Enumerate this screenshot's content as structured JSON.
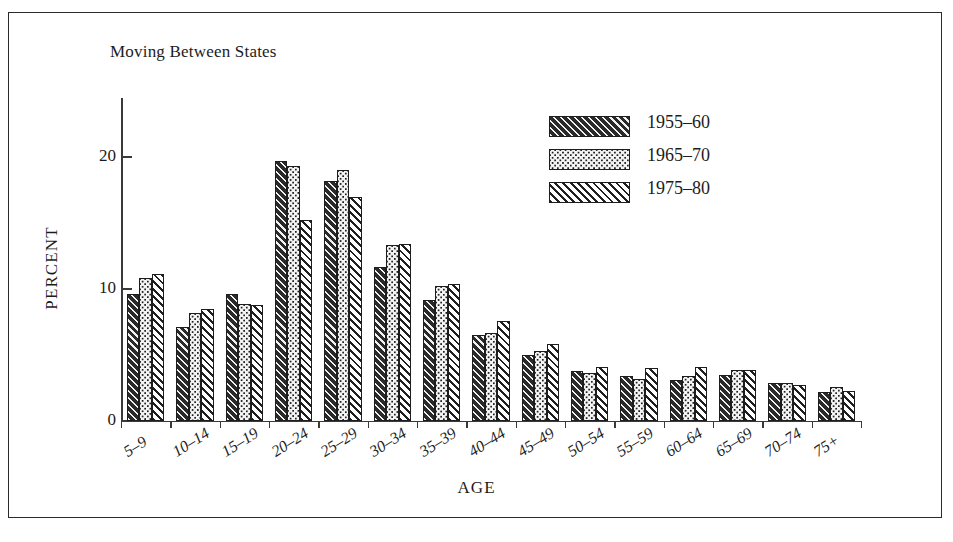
{
  "figure": {
    "panel_title": "Moving Between States"
  },
  "chart_data": {
    "type": "bar",
    "title": "Moving Between States",
    "xlabel": "AGE",
    "ylabel": "PERCENT",
    "ylim": [
      0,
      24.5
    ],
    "yticks": [
      0,
      10,
      20
    ],
    "ytick_labels": [
      "0",
      "10",
      "20"
    ],
    "grid": false,
    "legend_position": "top-right",
    "categories": [
      "5–9",
      "10–14",
      "15–19",
      "20–24",
      "25–29",
      "30–34",
      "35–39",
      "40–44",
      "45–49",
      "50–54",
      "55–59",
      "60–64",
      "65–69",
      "70–74",
      "75+"
    ],
    "series": [
      {
        "name": "1955–60",
        "pattern": "dark-diagonal-hatch",
        "values": [
          9.6,
          7.1,
          9.6,
          19.7,
          18.2,
          11.7,
          9.2,
          6.5,
          5.0,
          3.8,
          3.4,
          3.1,
          3.5,
          2.9,
          2.2
        ]
      },
      {
        "name": "1965–70",
        "pattern": "dark-dot-checker",
        "values": [
          10.8,
          8.2,
          8.9,
          19.3,
          19.0,
          13.3,
          10.2,
          6.7,
          5.3,
          3.6,
          3.2,
          3.4,
          3.9,
          2.9,
          2.6
        ]
      },
      {
        "name": "1975–80",
        "pattern": "white-diagonal-hatch",
        "values": [
          11.1,
          8.5,
          8.8,
          15.2,
          17.0,
          13.4,
          10.4,
          7.6,
          5.8,
          4.1,
          4.0,
          4.1,
          3.9,
          2.7,
          2.3
        ]
      }
    ]
  },
  "legend": {
    "entries": [
      {
        "label": "1955–60",
        "pattern": "pat-a"
      },
      {
        "label": "1965–70",
        "pattern": "pat-b"
      },
      {
        "label": "1975–80",
        "pattern": "pat-c"
      }
    ]
  }
}
